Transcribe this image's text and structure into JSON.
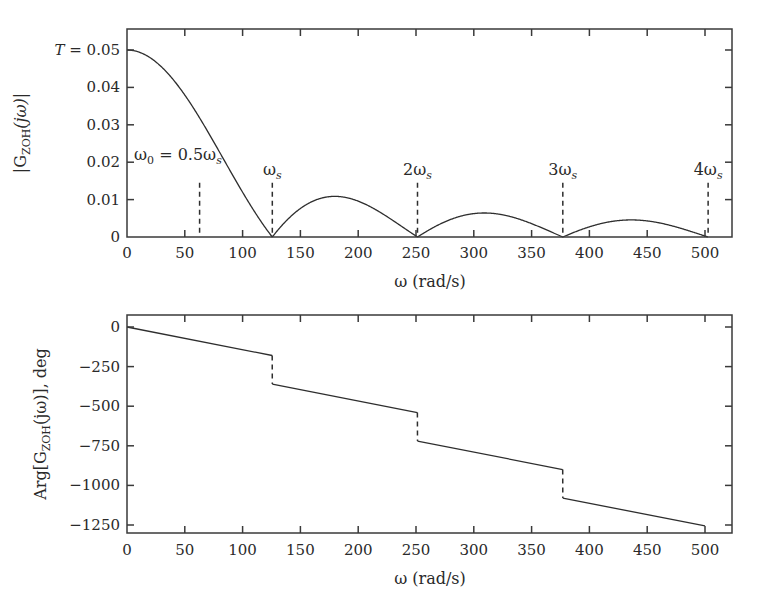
{
  "chart_data": [
    {
      "type": "line",
      "title": "",
      "xlabel": "ω (rad/s)",
      "ylabel": "|G_ZOH(jω)|",
      "xlim": [
        0,
        525
      ],
      "ylim": [
        0,
        0.055
      ],
      "grid": false,
      "legend": null,
      "x_ticks": [
        0,
        50,
        100,
        150,
        200,
        250,
        300,
        350,
        400,
        450,
        500
      ],
      "x_tick_labels": [
        "0",
        "50",
        "100",
        "150",
        "200",
        "250",
        "300",
        "350",
        "400",
        "450",
        "500"
      ],
      "y_ticks": [
        0,
        0.01,
        0.02,
        0.03,
        0.04,
        0.05
      ],
      "y_tick_labels": [
        "0",
        "0.01",
        "0.02",
        "0.03",
        "0.04",
        "T = 0.05"
      ],
      "series": [
        {
          "name": "|G_ZOH(jω)| = T·|sinc(ωT/2)|, T = 0.05",
          "T": 0.05,
          "x": [
            0,
            25,
            50,
            62.8,
            75,
            100,
            125.7,
            150,
            180,
            200,
            225,
            251.3,
            275,
            310,
            350,
            377,
            400,
            435,
            475,
            502.7
          ],
          "y": [
            0.05,
            0.0461,
            0.0362,
            0.0318,
            0.0254,
            0.0121,
            0.0,
            0.0061,
            0.0106,
            0.0096,
            0.0055,
            0.0,
            0.0042,
            0.0063,
            0.0032,
            0.0,
            0.0027,
            0.0045,
            0.0023,
            0.0
          ]
        }
      ],
      "markers": [
        {
          "x": 62.8,
          "label": "ω0 = 0.5ωs",
          "line_top_y": 0.0145
        },
        {
          "x": 125.7,
          "label": "ωs",
          "line_top_y": 0.0145
        },
        {
          "x": 251.3,
          "label": "2ωs",
          "line_top_y": 0.0145
        },
        {
          "x": 377.0,
          "label": "3ωs",
          "line_top_y": 0.0145
        },
        {
          "x": 502.7,
          "label": "4ωs",
          "line_top_y": 0.0145
        }
      ],
      "annotations": [
        "T = 0.05",
        "ω0 = 0.5ωs",
        "ωs",
        "2ωs",
        "3ωs",
        "4ωs"
      ]
    },
    {
      "type": "line",
      "title": "",
      "xlabel": "ω (rad/s)",
      "ylabel": "Arg[G_ZOH(jω)], deg",
      "xlim": [
        0,
        525
      ],
      "ylim": [
        -1300,
        0
      ],
      "grid": false,
      "legend": null,
      "x_ticks": [
        0,
        50,
        100,
        150,
        200,
        250,
        300,
        350,
        400,
        450,
        500
      ],
      "x_tick_labels": [
        "0",
        "50",
        "100",
        "150",
        "200",
        "250",
        "300",
        "350",
        "400",
        "450",
        "500"
      ],
      "y_ticks": [
        0,
        -250,
        -500,
        -750,
        -1000,
        -1250
      ],
      "y_tick_labels": [
        "0",
        "−250",
        "−500",
        "−750",
        "−1000",
        "−1250"
      ],
      "series": [
        {
          "name": "Arg[G_ZOH(jω)] = −ωT/2 (deg) with −180° jumps at kωs",
          "x": [
            0,
            125.6,
            125.7,
            251.2,
            251.3,
            376.9,
            377.0,
            500
          ],
          "y": [
            0,
            -180,
            -360,
            -540,
            -720,
            -900,
            -1080,
            -1256
          ]
        }
      ],
      "discontinuities_x": [
        125.7,
        251.3,
        377.0
      ],
      "annotations": []
    }
  ],
  "figure": {
    "top": {
      "ylabel_main": "|G",
      "ylabel_sub": "ZOH",
      "ylabel_tail": "(jω)|",
      "xlabel": "ω (rad/s)",
      "T_label": "T",
      "marker_labels": [
        {
          "main": "ω",
          "sub": "0",
          "rest": " = 0.5ω",
          "rest_sub": "s"
        },
        {
          "main": "ω",
          "sub": "s"
        },
        {
          "main": "2ω",
          "sub": "s"
        },
        {
          "main": "3ω",
          "sub": "s"
        },
        {
          "main": "4ω",
          "sub": "s"
        }
      ]
    },
    "bottom": {
      "ylabel_pre": "Arg[G",
      "ylabel_sub": "ZOH",
      "ylabel_tail": "(jω)], deg",
      "xlabel": "ω (rad/s)"
    },
    "colors": {
      "line": "#2e2e2e",
      "axes": "#3a3a3a",
      "background": "#ffffff"
    }
  }
}
